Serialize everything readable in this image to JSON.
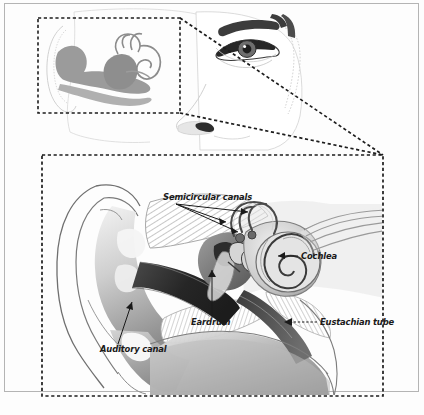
{
  "figure": {
    "kind": "anatomical-illustration",
    "outer_frame": {
      "present": true,
      "color": "#b4b4b4"
    },
    "background_color": "#fdfdfd",
    "ink_color": "#1a1a1a"
  },
  "panels": {
    "head": {
      "name": "head-profile-panel",
      "description": "Faded line drawing of a face in three-quarter view with ear, eye, eyebrow and nose; ear anatomy overlaid inside a dashed detail box.",
      "detail_box": {
        "x": 38,
        "y": 18,
        "width": 142,
        "height": 95,
        "style": "dashed"
      }
    },
    "detail": {
      "name": "ear-cross-section-panel",
      "description": "Magnified cutaway cross-section of the ear showing outer, middle and inner ear.",
      "box": {
        "x": 42,
        "y": 155,
        "width": 341,
        "height": 241,
        "style": "dashed"
      }
    }
  },
  "callouts": {
    "note": "Dashed leader lines connecting the head detail box to the magnified panel",
    "lines": 2
  },
  "labels": [
    {
      "id": "semicircular-canals",
      "text": "Semicircular canals",
      "x": 163,
      "y": 200,
      "anchor": "start",
      "leaders": 3
    },
    {
      "id": "cochlea",
      "text": "Cochlea",
      "x": 301,
      "y": 259,
      "anchor": "start",
      "leaders": 1
    },
    {
      "id": "eardrum",
      "text": "Eardrum",
      "x": 191,
      "y": 325,
      "anchor": "start",
      "leaders": 1
    },
    {
      "id": "eustachian-tube",
      "text": "Eustachian tube",
      "x": 320,
      "y": 325,
      "anchor": "start",
      "leaders": 1
    },
    {
      "id": "auditory-canal",
      "text": "Auditory canal",
      "x": 100,
      "y": 352,
      "anchor": "start",
      "leaders": 1
    }
  ],
  "palette": {
    "ink": "#1a1a1a",
    "frame": "#b4b4b4",
    "face_line": "#d8d8d8",
    "ear_mid_gray": "#9a9a9a",
    "ear_dark": "#3a3a3a",
    "ear_light": "#e8e8e8",
    "hatch": "#bdbdbd",
    "canal_shadow": "#2b2b2b"
  }
}
